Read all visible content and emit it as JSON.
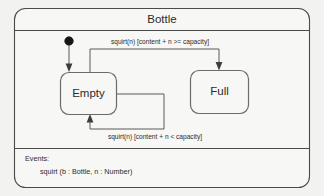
{
  "diagram": {
    "title": "Bottle",
    "kind": "uml-state-machine",
    "states": [
      {
        "id": "empty",
        "label": "Empty"
      },
      {
        "id": "full",
        "label": "Full"
      }
    ],
    "initial_state_marker": "filled-circle",
    "transitions": [
      {
        "id": "empty-to-full",
        "from": "Empty",
        "to": "Full",
        "label": "squirt(n) [content + n >= capacity]"
      },
      {
        "id": "empty-to-empty",
        "from": "Empty",
        "to": "Empty",
        "label": "squirt(n) [content + n < capacity]"
      },
      {
        "id": "initial-to-empty",
        "from": "initial",
        "to": "Empty",
        "label": ""
      }
    ],
    "events_compartment": {
      "heading": "Events:",
      "items": [
        "squirt (b : Bottle, n : Number)"
      ]
    },
    "colors": {
      "background": "#f2f2f0",
      "panel_fill": "#f7f7f5",
      "frame_stroke": "#4a4a4a",
      "state_stroke": "#6b6b6b",
      "edge_stroke": "#5a5a5a",
      "text": "#2b2b2b",
      "initial_marker": "#161616"
    }
  }
}
